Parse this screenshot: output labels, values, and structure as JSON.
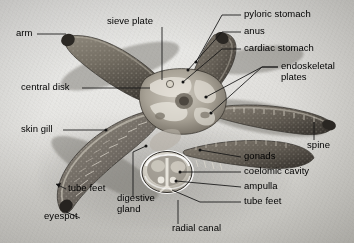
{
  "figure": {
    "background_color": "#e8e7e4",
    "label_color": "#000000",
    "leader_color": "#1a1a1a"
  },
  "labels": [
    {
      "id": "arm",
      "text": "arm",
      "x": 16,
      "y": 33,
      "align": "left"
    },
    {
      "id": "sieve-plate",
      "text": "sieve plate",
      "x": 107,
      "y": 21,
      "align": "left"
    },
    {
      "id": "pyloric-stomach",
      "text": "pyloric stomach",
      "x": 244,
      "y": 14,
      "align": "left"
    },
    {
      "id": "anus",
      "text": "anus",
      "x": 244,
      "y": 31,
      "align": "left"
    },
    {
      "id": "cardiac-stomach",
      "text": "cardiac stomach",
      "x": 244,
      "y": 48,
      "align": "left"
    },
    {
      "id": "endoskeletal-plates",
      "text": "endoskeletal plates",
      "x": 281,
      "y": 70,
      "align": "left",
      "multiline": true
    },
    {
      "id": "central-disk",
      "text": "central disk",
      "x": 21,
      "y": 87,
      "align": "left"
    },
    {
      "id": "skin-gill",
      "text": "skin gill",
      "x": 21,
      "y": 129,
      "align": "left"
    },
    {
      "id": "spine",
      "text": "spine",
      "x": 307,
      "y": 145,
      "align": "left"
    },
    {
      "id": "gonads",
      "text": "gonads",
      "x": 244,
      "y": 156,
      "align": "left"
    },
    {
      "id": "coelomic-cavity",
      "text": "coelomic cavity",
      "x": 244,
      "y": 171,
      "align": "left"
    },
    {
      "id": "ampulla",
      "text": "ampulla",
      "x": 244,
      "y": 186,
      "align": "left"
    },
    {
      "id": "tube-feet-right",
      "text": "tube feet",
      "x": 244,
      "y": 201,
      "align": "left"
    },
    {
      "id": "tube-feet-left",
      "text": "tube feet",
      "x": 68,
      "y": 188,
      "align": "left"
    },
    {
      "id": "digestive-gland",
      "text": "digestive gland",
      "x": 117,
      "y": 200,
      "align": "left",
      "multiline": true
    },
    {
      "id": "eyespot",
      "text": "eyespot",
      "x": 44,
      "y": 216,
      "align": "left"
    },
    {
      "id": "radial-canal",
      "text": "radial canal",
      "x": 172,
      "y": 228,
      "align": "left"
    }
  ],
  "anatomy_parts": [
    "arm",
    "sieve plate",
    "pyloric stomach",
    "anus",
    "cardiac stomach",
    "endoskeletal plates",
    "central disk",
    "skin gill",
    "spine",
    "gonads",
    "coelomic cavity",
    "ampulla",
    "tube feet",
    "digestive gland",
    "eyespot",
    "radial canal"
  ]
}
